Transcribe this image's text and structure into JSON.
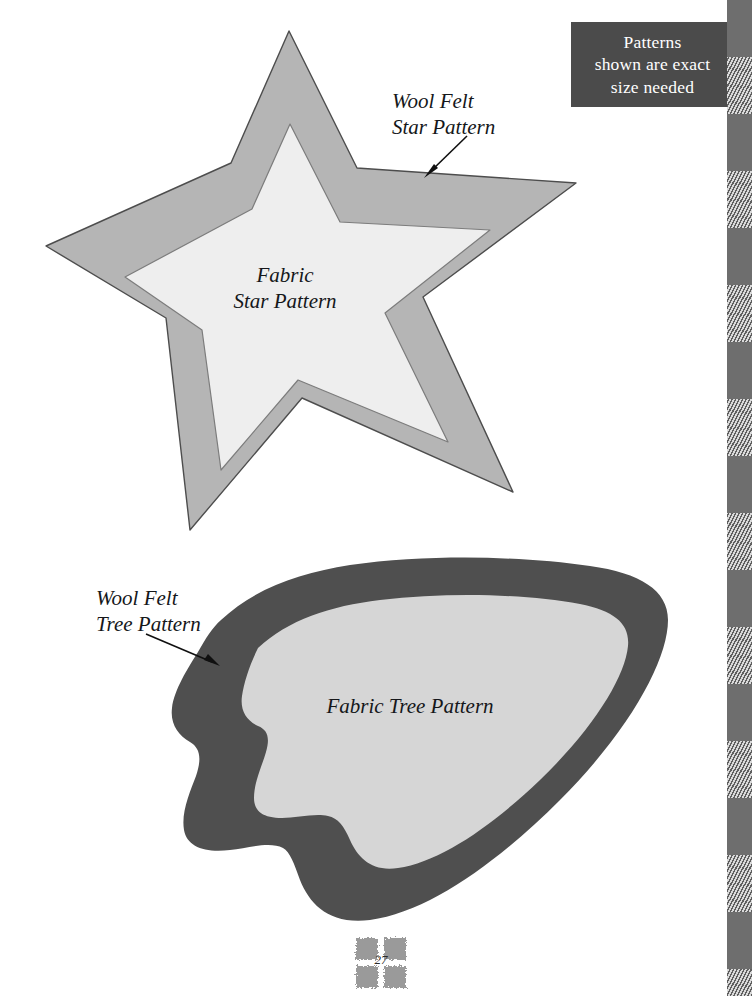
{
  "page": {
    "background_color": "#ffffff",
    "width": 752,
    "height": 996,
    "page_number": "27"
  },
  "note_box": {
    "background_color": "#4b4b4b",
    "text_color": "#ffffff",
    "lines": [
      "Patterns",
      "shown are exact",
      "size needed"
    ]
  },
  "star_pattern": {
    "outer": {
      "name": "wool-felt-star",
      "fill": "#b5b5b5",
      "stroke": "#5a5a5a",
      "label_lines": [
        "Wool Felt",
        "Star Pattern"
      ]
    },
    "inner": {
      "name": "fabric-star",
      "fill": "#eeeeee",
      "stroke": "#8a8a8a",
      "label_lines": [
        "Fabric",
        "Star Pattern"
      ]
    }
  },
  "tree_pattern": {
    "outer": {
      "name": "wool-felt-tree",
      "fill": "#4f4f4f",
      "label_lines": [
        "Wool Felt",
        "Tree Pattern"
      ]
    },
    "inner": {
      "name": "fabric-tree",
      "fill": "#d6d6d6",
      "label_lines": [
        "Fabric Tree Pattern"
      ]
    }
  },
  "border": {
    "name": "plaid-border-strip",
    "solid_color": "#6e6e6e",
    "hatch_dark": "#5f5f5f",
    "hatch_light": "#d9d9d9",
    "block_height": 57
  },
  "footer": {
    "ornament_name": "four-square-quilt-ornament",
    "ornament_color": "#9a9a9a"
  }
}
